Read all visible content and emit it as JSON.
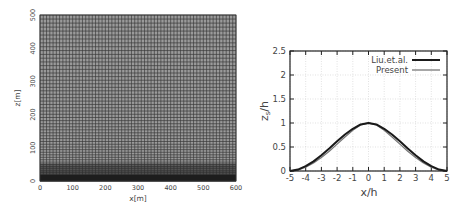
{
  "chart_data": [
    {
      "type": "heatmap",
      "title": "",
      "description": "Computational mesh (grid), refined near the bottom",
      "xlabel": "x[m]",
      "ylabel": "z[m]",
      "xlim": [
        0,
        600
      ],
      "ylim": [
        0,
        500
      ],
      "xticks": [
        0,
        100,
        200,
        300,
        400,
        500,
        600
      ],
      "yticks": [
        0,
        100,
        200,
        300,
        400,
        500
      ],
      "grid": true,
      "mesh": {
        "nx_cells": 60,
        "nz_cells_approx": 55,
        "refinement": "stretched toward z=0"
      }
    },
    {
      "type": "line",
      "title": "",
      "xlabel": "x/h",
      "ylabel": "z_s/h",
      "ylabel_main": "z",
      "ylabel_sub": "s",
      "ylabel_rest": "/h",
      "xlim": [
        -5,
        5
      ],
      "ylim": [
        0,
        2.5
      ],
      "xticks": [
        -5,
        -4,
        -3,
        -2,
        -1,
        0,
        1,
        2,
        3,
        4,
        5
      ],
      "yticks": [
        0,
        0.5,
        1,
        1.5,
        2,
        2.5
      ],
      "grid": true,
      "legend_position": "upper right",
      "x": [
        -5,
        -4.5,
        -4,
        -3.5,
        -3,
        -2.5,
        -2,
        -1.5,
        -1,
        -0.5,
        0,
        0.5,
        1,
        1.5,
        2,
        2.5,
        3,
        3.5,
        4,
        4.5,
        5
      ],
      "series": [
        {
          "name": "Liu.et.al.",
          "color": "#1a1a1a",
          "width": 2,
          "values": [
            0.0,
            0.03,
            0.1,
            0.2,
            0.33,
            0.47,
            0.62,
            0.76,
            0.88,
            0.97,
            1.0,
            0.97,
            0.88,
            0.76,
            0.62,
            0.47,
            0.33,
            0.2,
            0.1,
            0.03,
            0.0
          ]
        },
        {
          "name": "Present",
          "color": "#777777",
          "width": 1.3,
          "values": [
            0.0,
            0.02,
            0.08,
            0.17,
            0.28,
            0.41,
            0.56,
            0.71,
            0.85,
            0.96,
            1.0,
            0.96,
            0.85,
            0.71,
            0.56,
            0.41,
            0.28,
            0.17,
            0.08,
            0.02,
            0.0
          ]
        }
      ]
    }
  ]
}
